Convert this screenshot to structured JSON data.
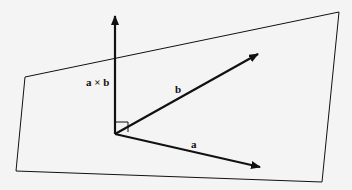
{
  "diagram": {
    "labels": {
      "cross": "a × b",
      "b": "b",
      "a": "a"
    },
    "colors": {
      "background": "#f4f4f4",
      "stroke": "#111111"
    },
    "elements": [
      {
        "type": "plane",
        "label": "plane containing a and b"
      },
      {
        "type": "vector",
        "name": "a"
      },
      {
        "type": "vector",
        "name": "b"
      },
      {
        "type": "vector",
        "name": "a × b",
        "note": "perpendicular to plane"
      },
      {
        "type": "right-angle-marker"
      }
    ]
  }
}
